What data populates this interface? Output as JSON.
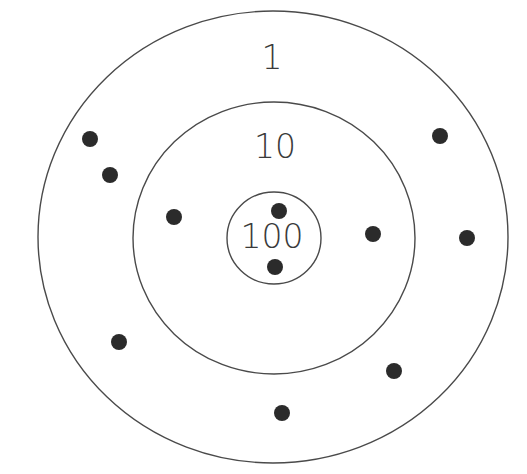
{
  "target": {
    "rings": [
      {
        "name": "outer",
        "label": "1",
        "cx": 273,
        "cy": 237,
        "rx": 235,
        "ry": 226,
        "label_x": 272,
        "label_y": 69
      },
      {
        "name": "middle",
        "label": "10",
        "cx": 274,
        "cy": 238,
        "rx": 141,
        "ry": 136,
        "label_x": 275,
        "label_y": 158
      },
      {
        "name": "inner",
        "label": "100",
        "cx": 274,
        "cy": 238,
        "rx": 47,
        "ry": 46,
        "label_x": 272,
        "label_y": 248
      }
    ],
    "dots": [
      {
        "x": 90,
        "y": 139
      },
      {
        "x": 110,
        "y": 175
      },
      {
        "x": 174,
        "y": 217
      },
      {
        "x": 279,
        "y": 211
      },
      {
        "x": 275,
        "y": 267
      },
      {
        "x": 373,
        "y": 234
      },
      {
        "x": 440,
        "y": 136
      },
      {
        "x": 467,
        "y": 238
      },
      {
        "x": 119,
        "y": 342
      },
      {
        "x": 394,
        "y": 371
      },
      {
        "x": 282,
        "y": 413
      }
    ],
    "dot_radius": 8,
    "colors": {
      "ring_stroke": "#4a4a4a",
      "dot_fill": "#2b2b2b",
      "label": "#3a3a3a",
      "background": "#ffffff"
    }
  }
}
